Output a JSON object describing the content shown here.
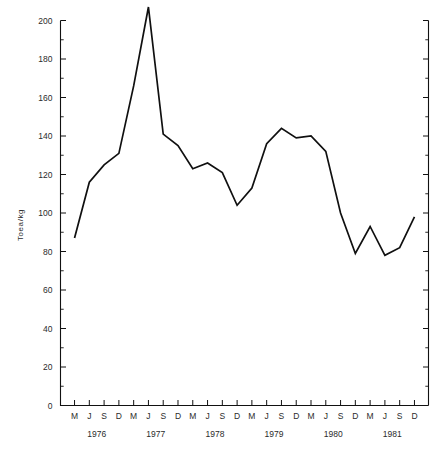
{
  "chart_data": {
    "type": "line",
    "title": "",
    "xlabel": "",
    "ylabel": "Toea/kg",
    "ylim": [
      0,
      200
    ],
    "ytick_values": [
      0,
      20,
      40,
      60,
      80,
      100,
      120,
      140,
      160,
      180,
      200
    ],
    "ytick_labels": [
      "0",
      "20",
      "40",
      "60",
      "80",
      "100",
      "120",
      "140",
      "160",
      "180",
      "200"
    ],
    "yminor_step": 10,
    "grid": false,
    "legend": "none",
    "right_axis_ticks": true,
    "right_axis_labels": false,
    "categories": [
      "M",
      "J",
      "S",
      "D",
      "M",
      "J",
      "S",
      "D",
      "M",
      "J",
      "S",
      "D",
      "M",
      "J",
      "S",
      "D",
      "M",
      "J",
      "S",
      "D",
      "M",
      "J",
      "S",
      "D"
    ],
    "year_groups": [
      {
        "label": "1976",
        "start_index": 0,
        "end_index": 3
      },
      {
        "label": "1977",
        "start_index": 4,
        "end_index": 7
      },
      {
        "label": "1978",
        "start_index": 8,
        "end_index": 11
      },
      {
        "label": "1979",
        "start_index": 12,
        "end_index": 15
      },
      {
        "label": "1980",
        "start_index": 16,
        "end_index": 19
      },
      {
        "label": "1981",
        "start_index": 20,
        "end_index": 23
      }
    ],
    "values": [
      87,
      116,
      125,
      131,
      166,
      207,
      141,
      135,
      123,
      126,
      121,
      104,
      113,
      136,
      144,
      139,
      140,
      132,
      100,
      79,
      93,
      78,
      82,
      98
    ],
    "series": [
      {
        "name": "Toea/kg",
        "values": [
          87,
          116,
          125,
          131,
          166,
          207,
          141,
          135,
          123,
          126,
          121,
          104,
          113,
          136,
          144,
          139,
          140,
          132,
          100,
          79,
          93,
          78,
          82,
          98
        ]
      }
    ],
    "peak": {
      "index": 5,
      "label": "J",
      "year": "1977",
      "value": 207
    },
    "minimum": {
      "index": 21,
      "label": "J",
      "year": "1981",
      "value": 78
    }
  },
  "caption": {
    "text": ""
  }
}
